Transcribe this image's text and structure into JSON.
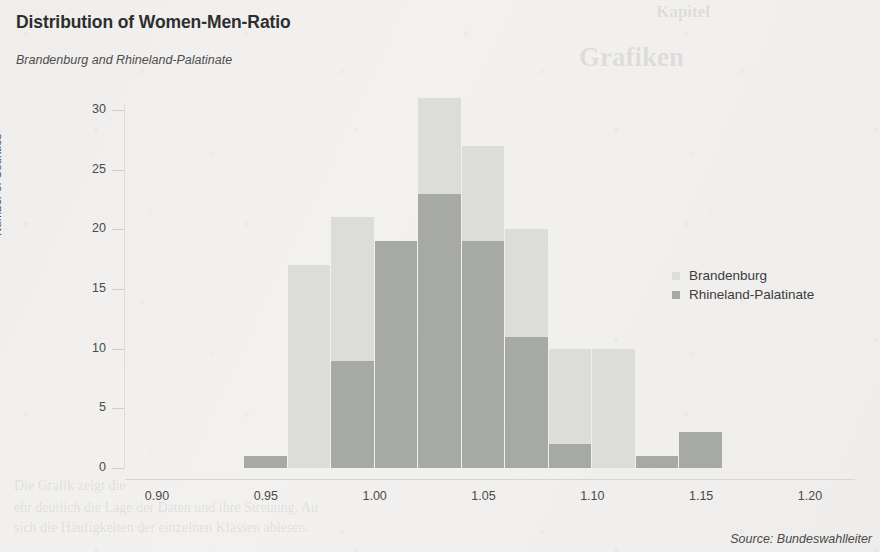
{
  "chart_title": "Distribution of Women-Men-Ratio",
  "chart_subtitle": "Brandenburg and Rhineland-Palatinate",
  "source_note": "Source: Bundeswahlleiter",
  "ghost_text": {
    "top_a": "Kapitel",
    "top_b": "Grafiken",
    "bottom_a": "Die Grafik zeigt die",
    "bottom_b": "ehr deutlich die Lage der Daten und ihre Streuung. Au",
    "bottom_c": "sich die Häufigkeiten der einzelnen Klassen ablesen."
  },
  "legend": {
    "position": "right",
    "items": [
      {
        "label": "Brandenburg",
        "color": "#dcdcd9"
      },
      {
        "label": "Rhineland-Palatinate",
        "color": "#a7a9a6"
      }
    ]
  },
  "colors": {
    "brandenburg": "#dcdcd9",
    "rhineland_palatinate": "#a7a9a6",
    "background": "#f2f1ef",
    "axis": "#d8d6d2",
    "text": "#4a4a4a",
    "title": "#2e2e2e"
  },
  "chart_data": {
    "type": "bar",
    "title": "Distribution of Women-Men-Ratio",
    "subtitle": "Brandenburg and Rhineland-Palatinate",
    "xlabel": "",
    "ylabel": "Number of Counties",
    "xlim": [
      0.9,
      1.2
    ],
    "ylim": [
      0,
      31
    ],
    "xticks": [
      "0.90",
      "0.95",
      "1.00",
      "1.05",
      "1.10",
      "1.15",
      "1.20"
    ],
    "xtick_values": [
      0.9,
      0.95,
      1.0,
      1.05,
      1.1,
      1.15,
      1.2
    ],
    "yticks": [
      "0",
      "5",
      "10",
      "15",
      "20",
      "25",
      "30"
    ],
    "ytick_values": [
      0,
      5,
      10,
      15,
      20,
      25,
      30
    ],
    "grid": false,
    "bin_width": 0.02,
    "bin_edges": [
      0.94,
      0.96,
      0.98,
      1.0,
      1.02,
      1.04,
      1.06,
      1.08,
      1.1,
      1.12,
      1.14,
      1.16
    ],
    "bin_starts": [
      0.94,
      0.96,
      0.98,
      1.0,
      1.02,
      1.04,
      1.06,
      1.08,
      1.1,
      1.12,
      1.14
    ],
    "series": [
      {
        "name": "Brandenburg",
        "color": "#dcdcd9",
        "values": [
          0,
          17,
          21,
          19,
          31,
          27,
          20,
          10,
          10,
          0,
          0
        ]
      },
      {
        "name": "Rhineland-Palatinate",
        "color": "#a7a9a6",
        "values": [
          1,
          0,
          9,
          19,
          23,
          19,
          11,
          2,
          0,
          1,
          3
        ]
      }
    ]
  }
}
